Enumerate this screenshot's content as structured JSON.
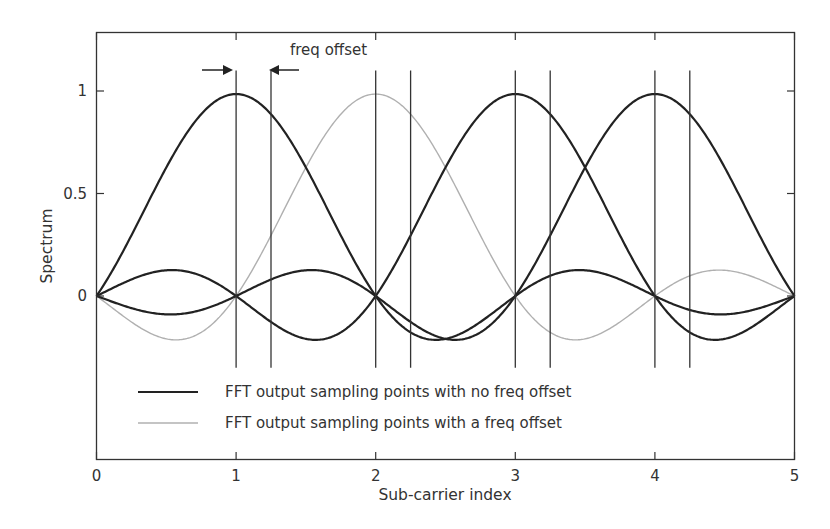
{
  "chart_data": {
    "type": "line",
    "title": "",
    "xlabel": "Sub-carrier index",
    "ylabel": "Spectrum",
    "xlim": [
      0,
      5
    ],
    "ylim": [
      -0.78,
      1.27
    ],
    "x_ticks": [
      0,
      1,
      2,
      3,
      4,
      5
    ],
    "x_tick_labels": [
      "0",
      "1",
      "2",
      "3",
      "4",
      "5"
    ],
    "y_ticks": [
      0,
      0.5,
      1
    ],
    "y_tick_labels": [
      "0",
      "0.5",
      "1"
    ],
    "grid": false,
    "legend_position": "lower-left inside",
    "function": "peak * sinc(x - center), sinc(t)=sin(pi t)/(pi t)",
    "series": [
      {
        "name": "FFT output sampling points with no freq offset",
        "style": "black",
        "center": 1,
        "peak": 0.985
      },
      {
        "name": "FFT output sampling points with a freq offset",
        "style": "gray",
        "center": 2,
        "peak": 0.985
      },
      {
        "name": "FFT output sampling points with no freq offset",
        "style": "black",
        "center": 3,
        "peak": 0.985
      },
      {
        "name": "FFT output sampling points with no freq offset",
        "style": "black",
        "center": 4,
        "peak": 0.985
      }
    ],
    "sample_points": {
      "x": [
        0,
        0.5,
        1,
        1.5,
        2,
        2.5,
        3,
        3.5,
        4,
        4.5,
        5
      ],
      "center_1": [
        0,
        0.627,
        0.985,
        0.627,
        0,
        -0.209,
        0,
        0.125,
        0,
        -0.09,
        0
      ],
      "center_2": [
        0,
        -0.209,
        0,
        0.627,
        0.985,
        0.627,
        0,
        -0.209,
        0,
        0.125,
        0
      ],
      "center_3": [
        0,
        0.125,
        0,
        -0.209,
        0,
        0.627,
        0.985,
        0.627,
        0,
        -0.209,
        0
      ],
      "center_4": [
        0,
        -0.09,
        0,
        0.125,
        0,
        -0.209,
        0,
        0.627,
        0.985,
        0.627,
        0
      ]
    },
    "vertical_lines": {
      "no_offset": [
        1,
        2,
        3,
        4
      ],
      "with_offset": [
        1.25,
        2.25,
        3.25,
        4.25
      ],
      "y_range": [
        -0.35,
        1.1
      ]
    },
    "annotations": [
      {
        "text": "freq offset",
        "x": 1.4,
        "y": 1.19,
        "arrows": "pointing inward between x=1 and x=1.25"
      }
    ],
    "legend": [
      {
        "label": "FFT output sampling points with no freq offset",
        "color": "#222222"
      },
      {
        "label": "FFT output sampling points with a freq offset",
        "color": "#b0b0b0"
      }
    ],
    "colors": {
      "no_offset": "#222222",
      "with_offset": "#b0b0b0",
      "axes": "#333333"
    }
  }
}
